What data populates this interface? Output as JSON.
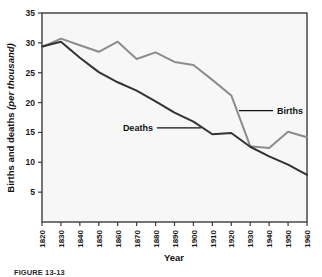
{
  "figure": {
    "caption": "FIGURE 13-13",
    "background_color": "#ffffff",
    "plot_background_color": "#f7f7f7",
    "frame_color": "#3d3d3d"
  },
  "chart_data": {
    "type": "line",
    "title": "",
    "xlabel": "Year",
    "ylabel": "Births and deaths",
    "ylabel_italic_suffix": "(per thousand)",
    "ylim": [
      0,
      35
    ],
    "xlim": [
      1820,
      1960
    ],
    "grid": false,
    "legend_position": "inline-annotation",
    "x": [
      1820,
      1830,
      1840,
      1850,
      1860,
      1870,
      1880,
      1890,
      1900,
      1910,
      1920,
      1930,
      1940,
      1950,
      1960
    ],
    "xticks": [
      "1820",
      "1830",
      "1840",
      "1850",
      "1860",
      "1870",
      "1880",
      "1890",
      "1900",
      "1910",
      "1920",
      "1930",
      "1940",
      "1950",
      "1960"
    ],
    "yticks": [
      "5",
      "10",
      "15",
      "20",
      "25",
      "30",
      "35"
    ],
    "ytick_values": [
      5,
      10,
      15,
      20,
      25,
      30,
      35
    ],
    "series": [
      {
        "name": "Births",
        "color": "#8c8c8c",
        "label_text": "Births",
        "values": [
          29.3,
          30.7,
          29.6,
          28.5,
          30.2,
          27.3,
          28.4,
          26.8,
          26.3,
          23.8,
          21.2,
          12.7,
          12.4,
          15.1,
          14.2
        ]
      },
      {
        "name": "Deaths",
        "color": "#333333",
        "label_text": "Deaths",
        "values": [
          29.4,
          30.2,
          27.5,
          25.1,
          23.4,
          22.0,
          20.2,
          18.3,
          16.8,
          14.7,
          14.9,
          12.6,
          11.0,
          9.6,
          7.9
        ]
      }
    ],
    "annotations": [
      {
        "text": "Births",
        "series": "Births",
        "anchor_x": 1923,
        "anchor_y": 25.0
      },
      {
        "text": "Deaths",
        "series": "Deaths",
        "anchor_x": 1862,
        "anchor_y": 16.6
      }
    ]
  }
}
